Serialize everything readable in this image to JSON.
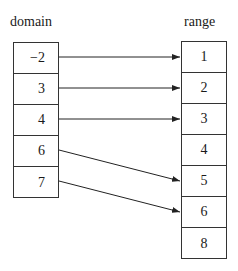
{
  "diagram": {
    "domain_label": "domain",
    "range_label": "range",
    "domain": [
      "−2",
      "3",
      "4",
      "6",
      "7"
    ],
    "range": [
      "1",
      "2",
      "3",
      "4",
      "5",
      "6",
      "8"
    ],
    "mappings": [
      {
        "from": "−2",
        "to": "1"
      },
      {
        "from": "3",
        "to": "2"
      },
      {
        "from": "4",
        "to": "3"
      },
      {
        "from": "6",
        "to": "5"
      },
      {
        "from": "7",
        "to": "6"
      }
    ]
  }
}
